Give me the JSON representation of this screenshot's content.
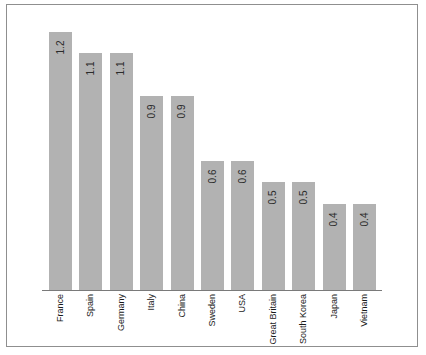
{
  "figure": {
    "background_color": "#ffffff",
    "frame_border_color": "#8f8f8f",
    "bar_color": "#b2b2b2",
    "axis_color": "#7a7a7a",
    "value_label_color": "#2b2b2b",
    "category_label_color": "#1a1a1a"
  },
  "chart_data": {
    "type": "bar",
    "title": "",
    "subtitle": "",
    "xlabel": "",
    "ylabel": "",
    "orientation": "vertical",
    "grid": false,
    "legend": false,
    "legend_position": "none",
    "yaxis_visible": false,
    "xaxis_visible": true,
    "value_labels_shown": true,
    "value_label_rotation": -90,
    "category_label_rotation": -90,
    "ylim": [
      0,
      1.3
    ],
    "categories": [
      "France",
      "Spain",
      "Germany",
      "Italy",
      "China",
      "Sweden",
      "USA",
      "Great Britain",
      "South Korea",
      "Japan",
      "Vietnam"
    ],
    "values": [
      1.2,
      1.1,
      1.1,
      0.9,
      0.9,
      0.6,
      0.6,
      0.5,
      0.5,
      0.4,
      0.4
    ],
    "value_labels": [
      "1.2",
      "1.1",
      "1.1",
      "0.9",
      "0.9",
      "0.6",
      "0.6",
      "0.5",
      "0.5",
      "0.4",
      "0.4"
    ]
  }
}
